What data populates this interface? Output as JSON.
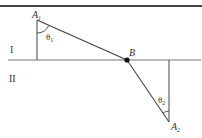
{
  "diagram": {
    "type": "refraction-geometry",
    "colors": {
      "line": "#555555",
      "border": "#444444",
      "point": "#111111"
    },
    "regions": {
      "upper": "I",
      "lower": "II"
    },
    "points": {
      "A1": {
        "label": "A",
        "subscript": "1"
      },
      "B": {
        "label": "B"
      },
      "A2": {
        "label": "A",
        "subscript": "2"
      }
    },
    "angles": {
      "theta1": {
        "symbol": "θ",
        "subscript": "1"
      },
      "theta2": {
        "symbol": "θ",
        "subscript": "2"
      }
    }
  }
}
